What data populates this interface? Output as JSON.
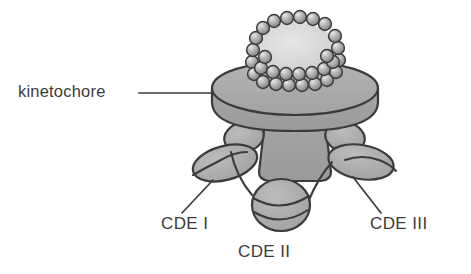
{
  "figure": {
    "type": "biological-schematic",
    "background_color": "#ffffff",
    "outline_color": "#3b3b3b",
    "fill_gray": "#a9a9a9",
    "fill_gray_light": "#d9d9d9",
    "bead_color": "#9a9a9a",
    "bead_highlight": "#e2e2e2",
    "labels": {
      "kinetochore": "kinetochore",
      "cde1": "CDE I",
      "cde2": "CDE II",
      "cde3": "CDE III"
    },
    "leader_lines": [
      {
        "name": "kinetochore-leader",
        "x1": 139,
        "y1": 93,
        "x2": 212,
        "y2": 93
      },
      {
        "name": "cde1-leader",
        "x1": 182,
        "y1": 213,
        "x2": 213,
        "y2": 180
      },
      {
        "name": "cde3-leader",
        "x1": 381,
        "y1": 213,
        "x2": 353,
        "y2": 177
      }
    ],
    "parts": [
      {
        "name": "nucleosome-bead-coil",
        "description": "helical ring of nucleosome beads on top of kinetochore plate"
      },
      {
        "name": "kinetochore-plate",
        "description": "elliptical disc / cylinder slab"
      },
      {
        "name": "kinetochore-stem",
        "description": "trapezoidal central stem below the plate"
      },
      {
        "name": "cde1-blobs",
        "description": "left protein blobs bound at CDE I"
      },
      {
        "name": "cde3-blobs",
        "description": "right protein blobs bound at CDE III"
      },
      {
        "name": "cde2-nucleosome",
        "description": "central nucleosome with DNA wrapped, CDE II"
      },
      {
        "name": "dna-strand",
        "description": "centromeric DNA threading through CDE I, CDE II and CDE III"
      }
    ]
  }
}
